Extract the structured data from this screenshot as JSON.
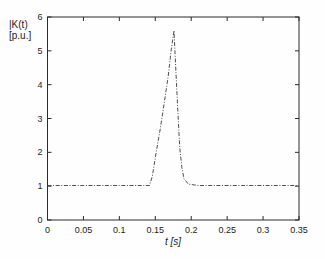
{
  "chart_data": {
    "type": "line",
    "title": "",
    "xlabel": "t [s]",
    "ylabel_line1": "|K(t)",
    "ylabel_line2": "[p.u.]",
    "xlim": [
      0,
      0.35
    ],
    "ylim": [
      0,
      6
    ],
    "grid": false,
    "legend": "none",
    "line_style": "dash-dot",
    "xticks": {
      "values": [
        0,
        0.05,
        0.1,
        0.15,
        0.2,
        0.25,
        0.3,
        0.35
      ],
      "labels": [
        "0",
        "0.05",
        "0.1",
        "0.15",
        "0.2",
        "0.25",
        "0.3",
        "0.35"
      ]
    },
    "yticks": {
      "values": [
        0,
        1,
        2,
        3,
        4,
        5,
        6
      ],
      "labels": [
        "0",
        "1",
        "2",
        "3",
        "4",
        "5",
        "6"
      ]
    },
    "series": [
      {
        "name": "K-factor magnitude",
        "points": [
          [
            0,
            1.02
          ],
          [
            0.05,
            1.02
          ],
          [
            0.1,
            1.02
          ],
          [
            0.142,
            1.02
          ],
          [
            0.146,
            1.3
          ],
          [
            0.15,
            1.85
          ],
          [
            0.157,
            2.7
          ],
          [
            0.162,
            3.4
          ],
          [
            0.168,
            4.25
          ],
          [
            0.172,
            5.0
          ],
          [
            0.176,
            5.6
          ],
          [
            0.178,
            4.7
          ],
          [
            0.18,
            3.85
          ],
          [
            0.182,
            2.95
          ],
          [
            0.184,
            2.15
          ],
          [
            0.187,
            1.55
          ],
          [
            0.19,
            1.22
          ],
          [
            0.196,
            1.06
          ],
          [
            0.21,
            1.02
          ],
          [
            0.27,
            1.02
          ],
          [
            0.35,
            1.02
          ]
        ]
      }
    ],
    "peak": {
      "t": 0.176,
      "value": 5.6
    },
    "baseline_value": 1.0
  },
  "layout_colors": {
    "background": "#fefefe",
    "axis": "#2b2b2b",
    "line": "#4f4f4f",
    "text": "#1c1c1c"
  }
}
